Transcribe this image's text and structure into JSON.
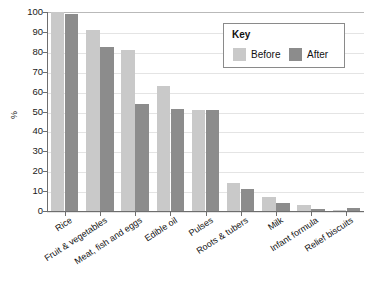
{
  "chart_data": {
    "type": "bar",
    "title": "",
    "subtitle": "",
    "xlabel": "",
    "ylabel": "%",
    "ylim": [
      0,
      100
    ],
    "ytick_step": 10,
    "yticks": [
      0,
      10,
      20,
      30,
      40,
      50,
      60,
      70,
      80,
      90,
      100
    ],
    "grid": true,
    "legend_position": "top-right",
    "legend_title": "Key",
    "categories": [
      "Rice",
      "Fruit & vegetables",
      "Meat, fish and eggs",
      "Edible oil",
      "Pulses",
      "Roots & tubers",
      "Milk",
      "Infant formula",
      "Relief biscuits"
    ],
    "series": [
      {
        "name": "Before",
        "color": "#c9c9c9",
        "values": [
          100,
          91,
          81,
          63,
          51,
          14,
          7,
          3,
          0.5
        ]
      },
      {
        "name": "After",
        "color": "#8c8c8c",
        "values": [
          99,
          82.5,
          54,
          51.5,
          51,
          11,
          4,
          1,
          1.5
        ]
      }
    ]
  },
  "axes": {
    "y_title": "%"
  },
  "colors": {
    "before": "#c9c9c9",
    "after": "#8c8c8c",
    "gridline": "#e4e4e4",
    "axis": "#6e6e6e",
    "text": "#111111",
    "legend_border": "#8a8a8a"
  }
}
